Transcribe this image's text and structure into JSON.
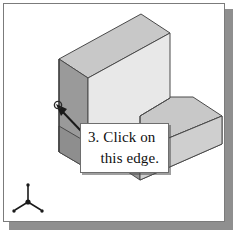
{
  "figure": {
    "kind": "isometric-cad-illustration",
    "frame": {
      "border_color": "#7b7b7b",
      "shadow_color": "#8f8f8f",
      "background": "#ffffff"
    },
    "solid": {
      "name": "stepped-l-block",
      "description": "Isometric view of an L-shaped stepped solid block",
      "face_colors": {
        "top": "#c8c8c8",
        "front_right": "#e8e8e8",
        "left_dark": "#9a9a9a",
        "side_mid": "#b4b4b4",
        "outline": "#4a4a4a"
      }
    },
    "callout": {
      "line1": "3. Click on",
      "line2": "this edge.",
      "border_color": "#6e6e6e",
      "background": "#ffffff"
    },
    "leader": {
      "name": "arrow-leader-line",
      "color": "#1a1a1a",
      "target_marker": "edge-selection-circle"
    },
    "axis_triad": {
      "name": "coordinate-axis-triad",
      "color": "#1a1a1a",
      "legs": [
        "z-up",
        "x-lower-right",
        "y-lower-left"
      ]
    }
  }
}
